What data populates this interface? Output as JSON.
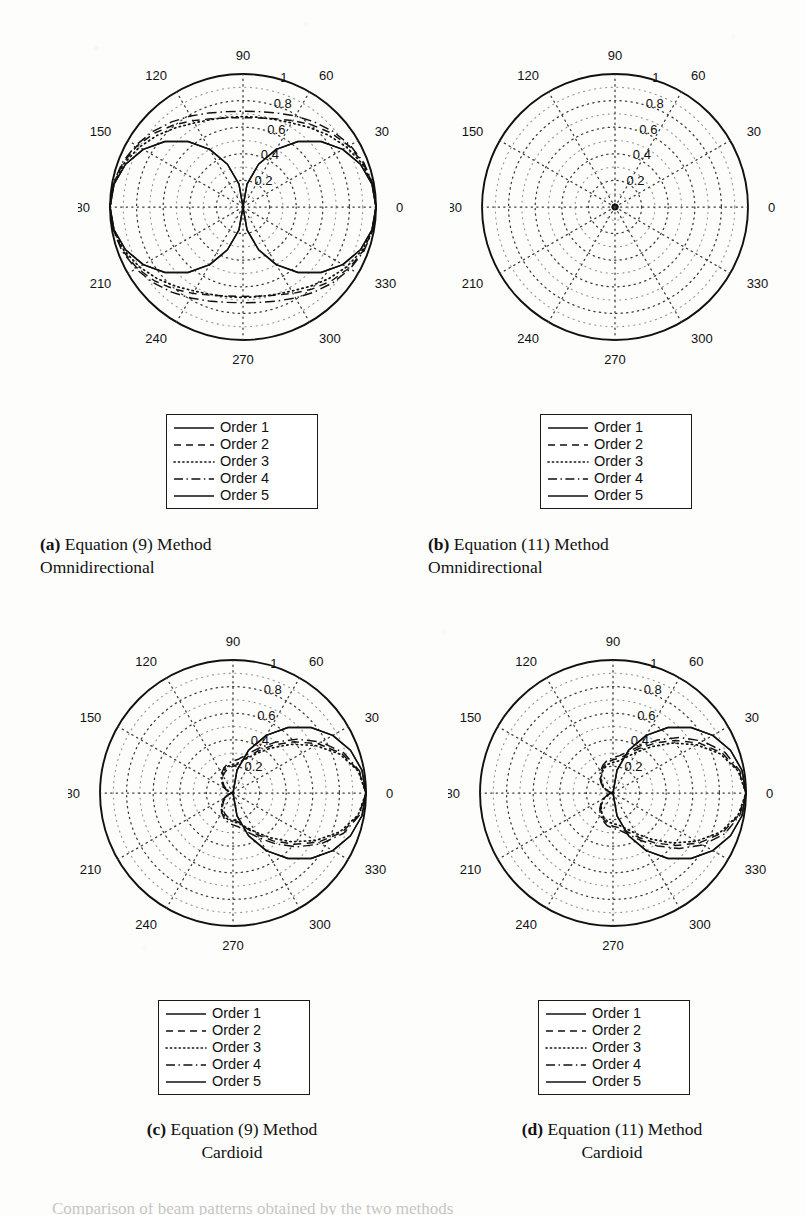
{
  "figure": {
    "panels": [
      {
        "id": "a",
        "tag": "(a)",
        "caption_line1": "Equation (9) Method",
        "caption_line2": "Omnidirectional",
        "caption_align": "left"
      },
      {
        "id": "b",
        "tag": "(b)",
        "caption_line1": "Equation (11) Method",
        "caption_line2": "Omnidirectional",
        "caption_align": "left"
      },
      {
        "id": "c",
        "tag": "(c)",
        "caption_line1": "Equation (9) Method",
        "caption_line2": "Cardioid",
        "caption_align": "center"
      },
      {
        "id": "d",
        "tag": "(d)",
        "caption_line1": "Equation (11) Method",
        "caption_line2": "Cardioid",
        "caption_align": "center"
      }
    ],
    "legend": {
      "entries": [
        {
          "label": "Order 1",
          "style": "solid"
        },
        {
          "label": "Order 2",
          "style": "dashed"
        },
        {
          "label": "Order 3",
          "style": "dotted"
        },
        {
          "label": "Order 4",
          "style": "dashdot"
        },
        {
          "label": "Order 5",
          "style": "solid"
        }
      ]
    },
    "bottom_cut_text": "Comparison of beam patterns obtained by the two methods"
  },
  "chart_data": [
    {
      "id": "a",
      "type": "line",
      "subtype": "polar",
      "title": "Equation (9) Method Omnidirectional",
      "angle_unit": "degrees",
      "angle_ticks": [
        0,
        30,
        60,
        90,
        120,
        150,
        180,
        210,
        240,
        270,
        300,
        330
      ],
      "radial_ticks": [
        0.2,
        0.4,
        0.6,
        0.8,
        1
      ],
      "rlim": [
        0,
        1
      ],
      "grid": true,
      "legend_position": "below-plot",
      "theta_deg": [
        0,
        10,
        20,
        30,
        40,
        50,
        60,
        70,
        80,
        90,
        100,
        110,
        120,
        130,
        140,
        150,
        160,
        170,
        180,
        190,
        200,
        210,
        220,
        230,
        240,
        250,
        260,
        270,
        280,
        290,
        300,
        310,
        320,
        330,
        340,
        350,
        360
      ],
      "series": [
        {
          "name": "Order 1",
          "style": "solid",
          "values": [
            1.0,
            0.985,
            0.94,
            0.866,
            0.766,
            0.643,
            0.5,
            0.342,
            0.174,
            0.0,
            0.174,
            0.342,
            0.5,
            0.643,
            0.766,
            0.866,
            0.94,
            0.985,
            1.0,
            0.985,
            0.94,
            0.866,
            0.766,
            0.643,
            0.5,
            0.342,
            0.174,
            0.0,
            0.174,
            0.342,
            0.5,
            0.643,
            0.766,
            0.866,
            0.94,
            0.985,
            1.0
          ]
        },
        {
          "name": "Order 2",
          "style": "dashed",
          "values": [
            1.0,
            0.99,
            0.962,
            0.92,
            0.866,
            0.806,
            0.75,
            0.706,
            0.68,
            0.672,
            0.68,
            0.706,
            0.75,
            0.806,
            0.866,
            0.92,
            0.962,
            0.99,
            1.0,
            0.99,
            0.962,
            0.92,
            0.866,
            0.806,
            0.75,
            0.706,
            0.68,
            0.672,
            0.68,
            0.706,
            0.75,
            0.806,
            0.866,
            0.92,
            0.962,
            0.99,
            1.0
          ]
        },
        {
          "name": "Order 3",
          "style": "dotted",
          "values": [
            1.0,
            0.988,
            0.953,
            0.9,
            0.84,
            0.78,
            0.73,
            0.7,
            0.685,
            0.68,
            0.685,
            0.7,
            0.73,
            0.78,
            0.84,
            0.9,
            0.953,
            0.988,
            1.0,
            0.988,
            0.953,
            0.9,
            0.84,
            0.78,
            0.73,
            0.7,
            0.685,
            0.68,
            0.685,
            0.7,
            0.73,
            0.78,
            0.84,
            0.9,
            0.953,
            0.988,
            1.0
          ]
        },
        {
          "name": "Order 4",
          "style": "dashdot",
          "values": [
            1.0,
            0.992,
            0.968,
            0.93,
            0.884,
            0.835,
            0.79,
            0.752,
            0.728,
            0.72,
            0.728,
            0.752,
            0.79,
            0.835,
            0.884,
            0.93,
            0.968,
            0.992,
            1.0,
            0.992,
            0.968,
            0.93,
            0.884,
            0.835,
            0.79,
            0.752,
            0.728,
            0.72,
            0.728,
            0.752,
            0.79,
            0.835,
            0.884,
            0.93,
            0.968,
            0.992,
            1.0
          ]
        },
        {
          "name": "Order 5",
          "style": "solid",
          "values": [
            1.0,
            0.985,
            0.94,
            0.866,
            0.766,
            0.643,
            0.5,
            0.342,
            0.174,
            0.0,
            0.174,
            0.342,
            0.5,
            0.643,
            0.766,
            0.866,
            0.94,
            0.985,
            1.0,
            0.985,
            0.94,
            0.866,
            0.766,
            0.643,
            0.5,
            0.342,
            0.174,
            0.0,
            0.174,
            0.342,
            0.5,
            0.643,
            0.766,
            0.866,
            0.94,
            0.985,
            1.0
          ]
        }
      ]
    },
    {
      "id": "b",
      "type": "line",
      "subtype": "polar",
      "title": "Equation (11) Method Omnidirectional",
      "angle_unit": "degrees",
      "angle_ticks": [
        0,
        30,
        60,
        90,
        120,
        150,
        180,
        210,
        240,
        270,
        300,
        330
      ],
      "radial_ticks": [
        0.2,
        0.4,
        0.6,
        0.8,
        1
      ],
      "rlim": [
        0,
        1
      ],
      "grid": true,
      "legend_position": "below-plot",
      "note": "All five orders collapse onto a near-zero circle at the origin (r ~ 0.02)",
      "theta_deg": [
        0,
        30,
        60,
        90,
        120,
        150,
        180,
        210,
        240,
        270,
        300,
        330,
        360
      ],
      "series": [
        {
          "name": "Order 1",
          "style": "solid",
          "values": [
            0.02,
            0.02,
            0.02,
            0.02,
            0.02,
            0.02,
            0.02,
            0.02,
            0.02,
            0.02,
            0.02,
            0.02,
            0.02
          ]
        },
        {
          "name": "Order 2",
          "style": "dashed",
          "values": [
            0.02,
            0.02,
            0.02,
            0.02,
            0.02,
            0.02,
            0.02,
            0.02,
            0.02,
            0.02,
            0.02,
            0.02,
            0.02
          ]
        },
        {
          "name": "Order 3",
          "style": "dotted",
          "values": [
            0.02,
            0.02,
            0.02,
            0.02,
            0.02,
            0.02,
            0.02,
            0.02,
            0.02,
            0.02,
            0.02,
            0.02,
            0.02
          ]
        },
        {
          "name": "Order 4",
          "style": "dashdot",
          "values": [
            0.02,
            0.02,
            0.02,
            0.02,
            0.02,
            0.02,
            0.02,
            0.02,
            0.02,
            0.02,
            0.02,
            0.02,
            0.02
          ]
        },
        {
          "name": "Order 5",
          "style": "solid",
          "values": [
            0.02,
            0.02,
            0.02,
            0.02,
            0.02,
            0.02,
            0.02,
            0.02,
            0.02,
            0.02,
            0.02,
            0.02,
            0.02
          ]
        }
      ]
    },
    {
      "id": "c",
      "type": "line",
      "subtype": "polar",
      "title": "Equation (9) Method Cardioid",
      "angle_unit": "degrees",
      "angle_ticks": [
        0,
        30,
        60,
        90,
        120,
        150,
        180,
        210,
        240,
        270,
        300,
        330
      ],
      "radial_ticks": [
        0.2,
        0.4,
        0.6,
        0.8,
        1
      ],
      "rlim": [
        0,
        1
      ],
      "grid": true,
      "legend_position": "below-plot",
      "note": "Cardioid lobes directed toward 0 degrees; maximum 1.0 at 0 deg, null at 180 deg",
      "theta_deg": [
        0,
        10,
        20,
        30,
        40,
        50,
        60,
        70,
        80,
        90,
        100,
        110,
        120,
        130,
        140,
        150,
        160,
        170,
        180,
        190,
        200,
        210,
        220,
        230,
        240,
        250,
        260,
        270,
        280,
        290,
        300,
        310,
        320,
        330,
        340,
        350,
        360
      ],
      "series": [
        {
          "name": "Order 1",
          "style": "solid",
          "values": [
            1.0,
            0.985,
            0.94,
            0.866,
            0.766,
            0.643,
            0.5,
            0.342,
            0.174,
            0.0,
            0.0,
            0.0,
            0.0,
            0.0,
            0.0,
            0.0,
            0.0,
            0.0,
            0.0,
            0.0,
            0.0,
            0.0,
            0.0,
            0.0,
            0.0,
            0.0,
            0.0,
            0.0,
            0.174,
            0.342,
            0.5,
            0.643,
            0.766,
            0.866,
            0.94,
            0.985,
            1.0
          ]
        },
        {
          "name": "Order 2",
          "style": "dashed",
          "values": [
            1.0,
            0.96,
            0.87,
            0.74,
            0.6,
            0.47,
            0.36,
            0.28,
            0.22,
            0.2,
            0.19,
            0.17,
            0.15,
            0.12,
            0.09,
            0.06,
            0.035,
            0.015,
            0.0,
            0.015,
            0.035,
            0.06,
            0.09,
            0.12,
            0.15,
            0.17,
            0.19,
            0.2,
            0.22,
            0.28,
            0.36,
            0.47,
            0.6,
            0.74,
            0.87,
            0.96,
            1.0
          ]
        },
        {
          "name": "Order 3",
          "style": "dotted",
          "values": [
            1.0,
            0.955,
            0.855,
            0.715,
            0.57,
            0.44,
            0.34,
            0.27,
            0.23,
            0.215,
            0.205,
            0.185,
            0.16,
            0.13,
            0.1,
            0.07,
            0.04,
            0.018,
            0.0,
            0.018,
            0.04,
            0.07,
            0.1,
            0.13,
            0.16,
            0.185,
            0.205,
            0.215,
            0.23,
            0.27,
            0.34,
            0.44,
            0.57,
            0.715,
            0.855,
            0.955,
            1.0
          ]
        },
        {
          "name": "Order 4",
          "style": "dashdot",
          "values": [
            1.0,
            0.965,
            0.885,
            0.765,
            0.63,
            0.5,
            0.39,
            0.31,
            0.26,
            0.24,
            0.225,
            0.2,
            0.17,
            0.14,
            0.105,
            0.075,
            0.045,
            0.02,
            0.0,
            0.02,
            0.045,
            0.075,
            0.105,
            0.14,
            0.17,
            0.2,
            0.225,
            0.24,
            0.26,
            0.31,
            0.39,
            0.5,
            0.63,
            0.765,
            0.885,
            0.965,
            1.0
          ]
        },
        {
          "name": "Order 5",
          "style": "solid",
          "values": [
            1.0,
            0.985,
            0.94,
            0.866,
            0.766,
            0.643,
            0.5,
            0.342,
            0.174,
            0.0,
            0.0,
            0.0,
            0.0,
            0.0,
            0.0,
            0.0,
            0.0,
            0.0,
            0.0,
            0.0,
            0.0,
            0.0,
            0.0,
            0.0,
            0.0,
            0.0,
            0.0,
            0.0,
            0.174,
            0.342,
            0.5,
            0.643,
            0.766,
            0.866,
            0.94,
            0.985,
            1.0
          ]
        }
      ]
    },
    {
      "id": "d",
      "type": "line",
      "subtype": "polar",
      "title": "Equation (11) Method Cardioid",
      "angle_unit": "degrees",
      "angle_ticks": [
        0,
        30,
        60,
        90,
        120,
        150,
        180,
        210,
        240,
        270,
        300,
        330
      ],
      "radial_ticks": [
        0.2,
        0.4,
        0.6,
        0.8,
        1
      ],
      "rlim": [
        0,
        1
      ],
      "grid": true,
      "legend_position": "below-plot",
      "note": "Cardioid lobes directed toward 0 degrees; nearly identical to panel (c)",
      "theta_deg": [
        0,
        10,
        20,
        30,
        40,
        50,
        60,
        70,
        80,
        90,
        100,
        110,
        120,
        130,
        140,
        150,
        160,
        170,
        180,
        190,
        200,
        210,
        220,
        230,
        240,
        250,
        260,
        270,
        280,
        290,
        300,
        310,
        320,
        330,
        340,
        350,
        360
      ],
      "series": [
        {
          "name": "Order 1",
          "style": "solid",
          "values": [
            1.0,
            0.985,
            0.94,
            0.866,
            0.766,
            0.643,
            0.5,
            0.342,
            0.174,
            0.0,
            0.0,
            0.0,
            0.0,
            0.0,
            0.0,
            0.0,
            0.0,
            0.0,
            0.0,
            0.0,
            0.0,
            0.0,
            0.0,
            0.0,
            0.0,
            0.0,
            0.0,
            0.0,
            0.174,
            0.342,
            0.5,
            0.643,
            0.766,
            0.866,
            0.94,
            0.985,
            1.0
          ]
        },
        {
          "name": "Order 2",
          "style": "dashed",
          "values": [
            1.0,
            0.96,
            0.875,
            0.75,
            0.615,
            0.49,
            0.385,
            0.31,
            0.265,
            0.25,
            0.235,
            0.21,
            0.18,
            0.145,
            0.11,
            0.08,
            0.045,
            0.02,
            0.0,
            0.02,
            0.045,
            0.08,
            0.11,
            0.145,
            0.18,
            0.21,
            0.235,
            0.25,
            0.265,
            0.31,
            0.385,
            0.49,
            0.615,
            0.75,
            0.875,
            0.96,
            1.0
          ]
        },
        {
          "name": "Order 3",
          "style": "dotted",
          "values": [
            1.0,
            0.955,
            0.86,
            0.725,
            0.585,
            0.455,
            0.355,
            0.285,
            0.245,
            0.23,
            0.22,
            0.197,
            0.17,
            0.138,
            0.105,
            0.074,
            0.042,
            0.019,
            0.0,
            0.019,
            0.042,
            0.074,
            0.105,
            0.138,
            0.17,
            0.197,
            0.22,
            0.23,
            0.245,
            0.285,
            0.355,
            0.455,
            0.585,
            0.725,
            0.86,
            0.955,
            1.0
          ]
        },
        {
          "name": "Order 4",
          "style": "dashdot",
          "values": [
            1.0,
            0.968,
            0.895,
            0.78,
            0.65,
            0.52,
            0.41,
            0.33,
            0.285,
            0.265,
            0.25,
            0.222,
            0.19,
            0.155,
            0.118,
            0.084,
            0.048,
            0.022,
            0.0,
            0.022,
            0.048,
            0.084,
            0.118,
            0.155,
            0.19,
            0.222,
            0.25,
            0.265,
            0.285,
            0.33,
            0.41,
            0.52,
            0.65,
            0.78,
            0.895,
            0.968,
            1.0
          ]
        },
        {
          "name": "Order 5",
          "style": "solid",
          "values": [
            1.0,
            0.985,
            0.94,
            0.866,
            0.766,
            0.643,
            0.5,
            0.342,
            0.174,
            0.0,
            0.0,
            0.0,
            0.0,
            0.0,
            0.0,
            0.0,
            0.0,
            0.0,
            0.0,
            0.0,
            0.0,
            0.0,
            0.0,
            0.0,
            0.0,
            0.0,
            0.0,
            0.0,
            0.174,
            0.342,
            0.5,
            0.643,
            0.766,
            0.866,
            0.94,
            0.985,
            1.0
          ]
        }
      ]
    }
  ],
  "colors": {
    "ink": "#111111",
    "grid": "#3a3a3a",
    "paper": "#fdfdfc"
  }
}
